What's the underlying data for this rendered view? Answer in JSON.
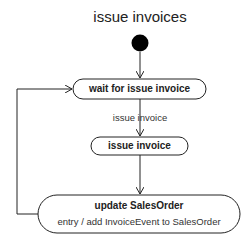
{
  "diagram": {
    "type": "uml-state-machine",
    "title": "issue invoices",
    "initial_node": {
      "shape": "filled-circle",
      "color": "#000000"
    },
    "states": [
      {
        "id": "wait",
        "name": "wait for issue invoice"
      },
      {
        "id": "issue",
        "name": "issue invoice"
      },
      {
        "id": "update",
        "name": "update SalesOrder",
        "entry_action": "entry / add InvoiceEvent to SalesOrder"
      }
    ],
    "transitions": [
      {
        "from": "initial",
        "to": "wait",
        "label": ""
      },
      {
        "from": "wait",
        "to": "issue",
        "label": "issue invoice"
      },
      {
        "from": "issue",
        "to": "update",
        "label": ""
      },
      {
        "from": "update",
        "to": "wait",
        "label": ""
      }
    ]
  }
}
